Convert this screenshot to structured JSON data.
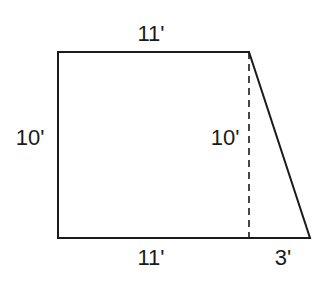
{
  "diagram": {
    "type": "trapezoid-dimensions",
    "stroke_color": "#1a1a1a",
    "labels": {
      "top": "11'",
      "left": "10'",
      "inner_height": "10'",
      "bottom_left": "11'",
      "bottom_right": "3'"
    }
  }
}
